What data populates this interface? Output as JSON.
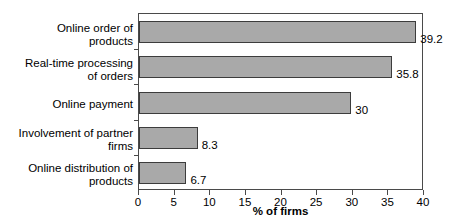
{
  "chart_data": {
    "type": "bar",
    "orientation": "horizontal",
    "title": "",
    "xlabel": "% of firms",
    "ylabel": "",
    "xlim": [
      0,
      40
    ],
    "xticks": [
      0,
      5,
      10,
      15,
      20,
      25,
      30,
      35,
      40
    ],
    "grid": false,
    "legend": null,
    "bar_color": "#a9a9a9",
    "bar_border_color": "#3c3c3c",
    "categories": [
      "Online order of products",
      "Real-time processing of orders",
      "Online payment",
      "Involvement of partner firms",
      "Online distribution of products"
    ],
    "values": [
      39.2,
      35.8,
      30,
      8.3,
      6.7
    ],
    "value_labels": [
      "39.2",
      "35.8",
      "30",
      "8.3",
      "6.7"
    ],
    "category_label_lines": [
      [
        "Online order of",
        "products"
      ],
      [
        "Real-time processing",
        "of orders"
      ],
      [
        "Online payment",
        ""
      ],
      [
        "Involvement of partner",
        "firms"
      ],
      [
        "Online distribution of",
        "products"
      ]
    ]
  },
  "axis": {
    "x_tick_labels": [
      "0",
      "5",
      "10",
      "15",
      "20",
      "25",
      "30",
      "35",
      "40"
    ],
    "x_title": "% of firms"
  }
}
